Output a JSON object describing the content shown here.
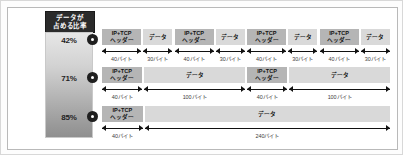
{
  "legend": {
    "title_line1": "データが",
    "title_line2": "占める比率",
    "percents": [
      "42%",
      "71%",
      "85%"
    ]
  },
  "markers": [
    "•",
    "•",
    "•"
  ],
  "labels": {
    "header_line1": "IP+TCP",
    "header_line2": "ヘッダー",
    "data": "データ"
  },
  "rows": [
    {
      "marker": "1",
      "percent": "42%",
      "segments": [
        {
          "kind": "header",
          "line1": "IP+TCP",
          "line2": "ヘッダー",
          "size": "40バイト",
          "bytes": 40
        },
        {
          "kind": "data",
          "line1": "データ",
          "line2": "",
          "size": "30バイト",
          "bytes": 30
        },
        {
          "kind": "header",
          "line1": "IP+TCP",
          "line2": "ヘッダー",
          "size": "40バイト",
          "bytes": 40
        },
        {
          "kind": "data",
          "line1": "データ",
          "line2": "",
          "size": "30バイト",
          "bytes": 30
        },
        {
          "kind": "header",
          "line1": "IP+TCP",
          "line2": "ヘッダー",
          "size": "40バイト",
          "bytes": 40
        },
        {
          "kind": "data",
          "line1": "データ",
          "line2": "",
          "size": "30バイト",
          "bytes": 30
        },
        {
          "kind": "header",
          "line1": "IP+TCP",
          "line2": "ヘッダー",
          "size": "40バイト",
          "bytes": 40
        },
        {
          "kind": "data",
          "line1": "データ",
          "line2": "",
          "size": "30バイト",
          "bytes": 30
        }
      ]
    },
    {
      "marker": "2",
      "percent": "71%",
      "segments": [
        {
          "kind": "header",
          "line1": "IP+TCP",
          "line2": "ヘッダー",
          "size": "40バイト",
          "bytes": 40
        },
        {
          "kind": "data",
          "line1": "データ",
          "line2": "",
          "size": "100バイト",
          "bytes": 100
        },
        {
          "kind": "header",
          "line1": "IP+TCP",
          "line2": "ヘッダー",
          "size": "40バイト",
          "bytes": 40
        },
        {
          "kind": "data",
          "line1": "データ",
          "line2": "",
          "size": "100バイト",
          "bytes": 100
        }
      ]
    },
    {
      "marker": "3",
      "percent": "85%",
      "segments": [
        {
          "kind": "header",
          "line1": "IP+TCP",
          "line2": "ヘッダー",
          "size": "40バイト",
          "bytes": 40
        },
        {
          "kind": "data",
          "line1": "データ",
          "line2": "",
          "size": "240バイト",
          "bytes": 240
        }
      ]
    }
  ],
  "chart_data": {
    "type": "bar",
    "xlabel": "",
    "ylabel": "",
    "categories": [
      "42%",
      "71%",
      "85%"
    ],
    "values": [
      42,
      71,
      85
    ],
    "series": [
      {
        "name": "IP+TCPヘッダー (バイト)",
        "values": [
          40,
          40,
          40
        ]
      },
      {
        "name": "データ (バイト)",
        "values": [
          30,
          100,
          240
        ]
      }
    ],
    "annotations": [
      "① 40バイトヘッダー + 30バイトデータ × 4 = 42%",
      "② 40バイトヘッダー + 100バイトデータ × 2 = 71%",
      "③ 40バイトヘッダー + 240バイトデータ × 1 = 85%"
    ],
    "grid": false,
    "legend": "none"
  },
  "colors": {
    "header_bar": "#b5b5b5",
    "data_bar": "#d9d9d9",
    "chip_bg": "#2b2b2b",
    "text": "#111111",
    "frame": "#b9b9b9"
  }
}
